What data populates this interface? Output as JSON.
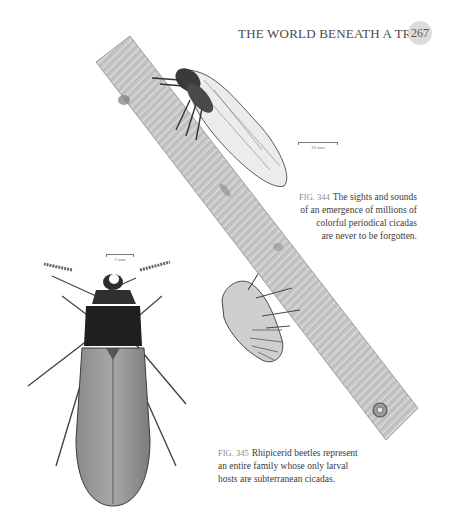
{
  "header": {
    "running_title": "THE WORLD BENEATH A TREE",
    "page_number": "267"
  },
  "figures": [
    {
      "id": "fig344",
      "label": "FIG. 344",
      "caption": "The sights and sounds of an emergence of millions of colorful periodical cicadas are never to be forgotten.",
      "caption_lines": [
        "The sights and sounds",
        "of an emergence of millions of",
        "colorful periodical cicadas",
        "are never to be forgotten."
      ],
      "scale_bar": "10 mm",
      "illustration": "Adult periodical cicada and nymph exuvia on a diagonal branch"
    },
    {
      "id": "fig345",
      "label": "FIG. 345",
      "caption": "Rhipicerid beetles represent an entire family whose only larval hosts are subterranean cicadas.",
      "caption_lines": [
        "Rhipicerid beetles represent",
        "an entire family whose only larval",
        "hosts are subterranean cicadas."
      ],
      "scale_bar": "2 mm",
      "illustration": "Rhipicerid beetle, dorsal view"
    }
  ],
  "colors": {
    "page_bg": "#ffffff",
    "page_badge": "#dcdcdc",
    "text": "#3c3c3c",
    "fig_label": "#8a8a8a"
  }
}
